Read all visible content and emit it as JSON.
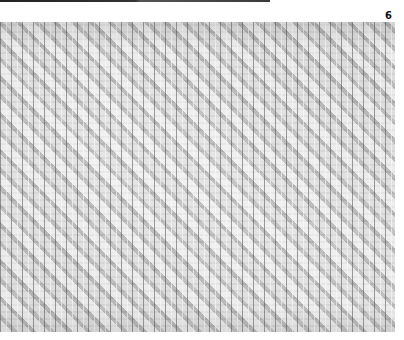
{
  "page": {
    "page_number": "6",
    "top_rule": true
  },
  "figure": {
    "subject": "woven textile close-up, twill / diagonal weave pattern",
    "color_mode": "grayscale",
    "colors": {
      "base": "#c9c9c9",
      "highlight": "#f2f2f2",
      "shadow": "#6e6e6e",
      "page_background": "#ffffff",
      "rule": "#222222"
    }
  }
}
